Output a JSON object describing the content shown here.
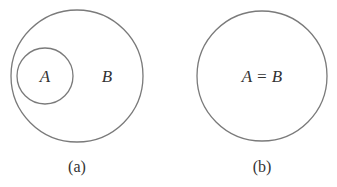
{
  "diagrams": [
    {
      "caption": "(a)",
      "outer_label": "B",
      "inner_label": "A",
      "description": "A is a subset of B"
    },
    {
      "caption": "(b)",
      "label": "A = B",
      "description": "A equals B"
    }
  ],
  "colors": {
    "stroke": "#7a7a7a",
    "text": "#333333",
    "background": "#ffffff"
  }
}
